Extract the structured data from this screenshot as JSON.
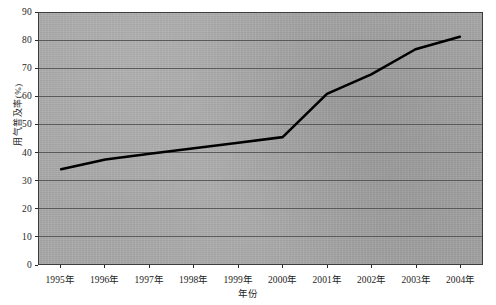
{
  "chart_data": {
    "type": "line",
    "title": "",
    "xlabel": "年份",
    "ylabel": "用气普及率(%)",
    "categories": [
      "1995年",
      "1996年",
      "1997年",
      "1998年",
      "1999年",
      "2000年",
      "2001年",
      "2002年",
      "2003年",
      "2004年"
    ],
    "values": [
      34,
      37.5,
      39.5,
      41.5,
      43.5,
      45.5,
      61,
      68,
      77,
      81.5
    ],
    "series": [
      {
        "name": "用气普及率",
        "values": [
          34,
          37.5,
          39.5,
          41.5,
          43.5,
          45.5,
          61,
          68,
          77,
          81.5
        ],
        "color": "#000000"
      }
    ],
    "ylim": [
      0,
      90
    ],
    "ytick_step": 10,
    "yticks": [
      0,
      10,
      20,
      30,
      40,
      50,
      60,
      70,
      80,
      90
    ],
    "ytick_labels": [
      "0",
      "10",
      "20",
      "30",
      "40",
      "50",
      "60",
      "70",
      "80",
      "90"
    ],
    "grid": true,
    "grid_axis": "y",
    "legend": false,
    "legend_position": "none",
    "plot_background": "#a9a9a9",
    "grid_color": "#595959",
    "frame_color": "#3d3d3d",
    "line_color": "#000000",
    "line_width": 2.6,
    "markers": false
  },
  "axis": {
    "y_title": "用气普及率(%)",
    "x_title": "年份"
  }
}
